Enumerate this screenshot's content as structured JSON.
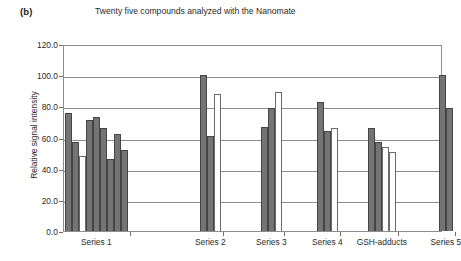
{
  "panel_label": "(b)",
  "title": "Twenty five compounds analyzed with the Nanomate",
  "axis": {
    "y_title": "Relative signal intensity",
    "y_ticks": [
      "120.0",
      "100.0",
      "80.0",
      "60.0",
      "40.0",
      "20.0",
      "0.0"
    ]
  },
  "chart_data": {
    "type": "bar",
    "title": "Twenty five compounds analyzed with the Nanomate",
    "xlabel": "",
    "ylabel": "Relative signal intensity",
    "ylim": [
      0,
      120
    ],
    "ytick_step": 20,
    "grid": true,
    "legend": "none",
    "categories": [
      "Series 1",
      "Series 2",
      "Series 3",
      "Series 4",
      "GSH-adducts",
      "Series 5"
    ],
    "colors": {
      "dark_fill": "#747474",
      "dark_edge": "#454545",
      "light_fill": "#ffffff",
      "light_edge": "#6a6a6a",
      "axis": "#8d8d8d",
      "text": "#2a2a2a"
    },
    "groups": [
      {
        "category": "Series 1",
        "bars": [
          {
            "value": 76,
            "style": "dark"
          },
          {
            "value": 57,
            "style": "dark"
          },
          {
            "value": 48,
            "style": "light"
          },
          {
            "value": 71,
            "style": "dark"
          },
          {
            "value": 73,
            "style": "dark"
          },
          {
            "value": 66,
            "style": "dark"
          },
          {
            "value": 46,
            "style": "dark"
          },
          {
            "value": 62,
            "style": "dark"
          },
          {
            "value": 52,
            "style": "dark"
          }
        ]
      },
      {
        "category": "Series 2",
        "bars": [
          {
            "value": 100,
            "style": "dark"
          },
          {
            "value": 61,
            "style": "dark"
          },
          {
            "value": 88,
            "style": "light"
          }
        ]
      },
      {
        "category": "Series 3",
        "bars": [
          {
            "value": 67,
            "style": "dark"
          },
          {
            "value": 79,
            "style": "dark"
          },
          {
            "value": 89,
            "style": "light"
          }
        ]
      },
      {
        "category": "Series 4",
        "bars": [
          {
            "value": 83,
            "style": "dark"
          },
          {
            "value": 64,
            "style": "dark"
          },
          {
            "value": 66,
            "style": "light"
          }
        ]
      },
      {
        "category": "GSH-adducts",
        "bars": [
          {
            "value": 66,
            "style": "dark"
          },
          {
            "value": 57,
            "style": "dark"
          },
          {
            "value": 54,
            "style": "light"
          },
          {
            "value": 51,
            "style": "light"
          }
        ]
      },
      {
        "category": "Series 5",
        "bars": [
          {
            "value": 100,
            "style": "dark"
          },
          {
            "value": 79,
            "style": "dark"
          }
        ]
      }
    ]
  }
}
